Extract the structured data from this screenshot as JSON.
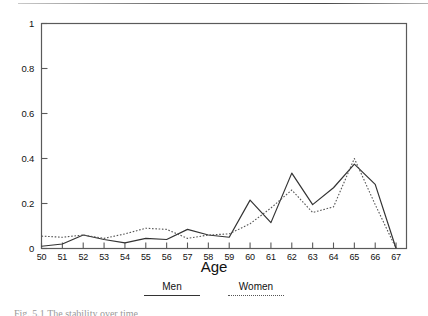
{
  "chart_data": {
    "type": "line",
    "title": "",
    "xlabel": "Age",
    "ylabel": "",
    "xlim": [
      50,
      67.5
    ],
    "ylim": [
      0,
      1
    ],
    "grid": false,
    "legend_position": "bottom",
    "x": [
      50,
      51,
      52,
      53,
      54,
      55,
      56,
      57,
      58,
      59,
      60,
      61,
      62,
      63,
      64,
      65,
      66,
      67
    ],
    "xtick_labels": [
      "50",
      "51",
      "52",
      "53",
      "54",
      "55",
      "56",
      "57",
      "58",
      "59",
      "60",
      "61",
      "62",
      "63",
      "64",
      "65",
      "66",
      "67"
    ],
    "ytick_labels": [
      "0",
      "0.2",
      "0.4",
      "0.6",
      "0.8",
      "1"
    ],
    "yticks": [
      0,
      0.2,
      0.4,
      0.6,
      0.8,
      1
    ],
    "series": [
      {
        "name": "Men",
        "style": "solid",
        "color": "#333333",
        "values": [
          0.01,
          0.02,
          0.06,
          0.04,
          0.025,
          0.045,
          0.04,
          0.085,
          0.06,
          0.05,
          0.215,
          0.115,
          0.335,
          0.195,
          0.27,
          0.375,
          0.285,
          0.0
        ]
      },
      {
        "name": "Women",
        "style": "dotted",
        "color": "#555555",
        "values": [
          0.055,
          0.05,
          0.06,
          0.045,
          0.065,
          0.09,
          0.085,
          0.045,
          0.06,
          0.065,
          0.11,
          0.18,
          0.26,
          0.16,
          0.185,
          0.4,
          0.195,
          0.0
        ]
      }
    ]
  },
  "legend": {
    "items": [
      {
        "label": "Men"
      },
      {
        "label": "Women"
      }
    ]
  },
  "caption": {
    "text": "Fig. 5.1   The stability over time"
  }
}
